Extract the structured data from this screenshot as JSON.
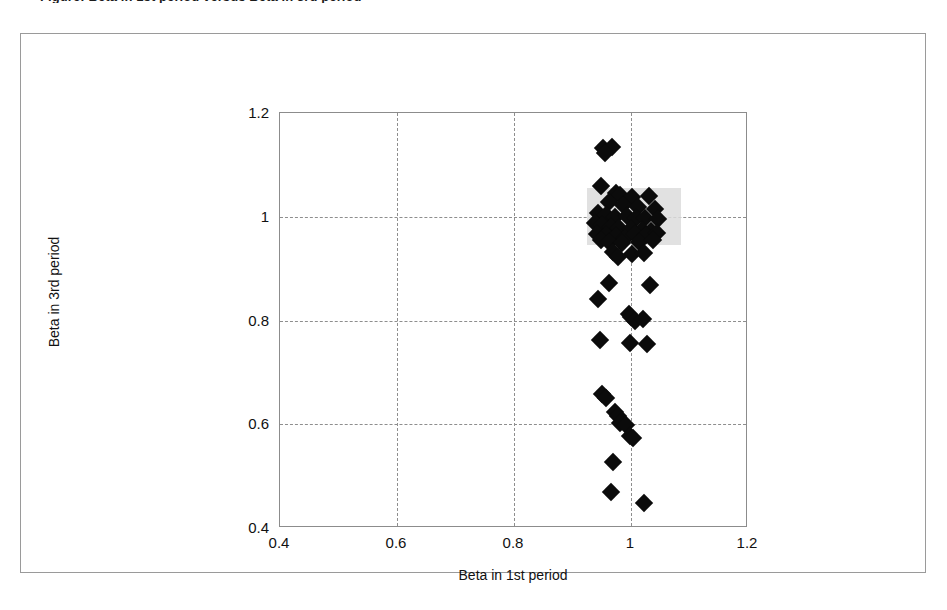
{
  "figure": {
    "caption": "Figure: Beta in 1st period versus Beta in 3rd period"
  },
  "chart_data": {
    "type": "scatter",
    "title": "",
    "xlabel": "Beta in 1st period",
    "ylabel": "Beta in 3rd period",
    "xlim": [
      0.4,
      1.2
    ],
    "ylim": [
      0.4,
      1.2
    ],
    "xticks": [
      "0.4",
      "0.6",
      "0.8",
      "1",
      "1.2"
    ],
    "yticks": [
      "0.4",
      "0.6",
      "0.8",
      "1",
      "1.2"
    ],
    "xtick_values": [
      0.4,
      0.6,
      0.8,
      1.0,
      1.2
    ],
    "ytick_values": [
      0.4,
      0.6,
      0.8,
      1.0,
      1.2
    ],
    "grid": true,
    "grid_style": "dashed",
    "legend": null,
    "marker": "diamond",
    "marker_color": "#0b0b0b",
    "highlight_region": {
      "label": "selection-highlight",
      "color": "#dcdcdc",
      "x_range": [
        0.925,
        1.085
      ],
      "y_range": [
        0.945,
        1.055
      ]
    },
    "points": [
      {
        "x": 0.952,
        "y": 1.133
      },
      {
        "x": 0.968,
        "y": 1.135
      },
      {
        "x": 0.955,
        "y": 1.122
      },
      {
        "x": 0.949,
        "y": 1.059
      },
      {
        "x": 0.975,
        "y": 1.046
      },
      {
        "x": 0.982,
        "y": 1.041
      },
      {
        "x": 1.002,
        "y": 1.038
      },
      {
        "x": 1.03,
        "y": 1.04
      },
      {
        "x": 0.962,
        "y": 1.028
      },
      {
        "x": 0.986,
        "y": 1.022
      },
      {
        "x": 1.012,
        "y": 1.018
      },
      {
        "x": 1.041,
        "y": 1.015
      },
      {
        "x": 0.944,
        "y": 1.008
      },
      {
        "x": 0.958,
        "y": 1.003
      },
      {
        "x": 0.972,
        "y": 1.0
      },
      {
        "x": 0.994,
        "y": 1.001
      },
      {
        "x": 1.008,
        "y": 0.998
      },
      {
        "x": 1.024,
        "y": 0.997
      },
      {
        "x": 1.046,
        "y": 0.995
      },
      {
        "x": 0.938,
        "y": 0.988
      },
      {
        "x": 0.951,
        "y": 0.984
      },
      {
        "x": 0.966,
        "y": 0.981
      },
      {
        "x": 0.98,
        "y": 0.978
      },
      {
        "x": 1.0,
        "y": 0.976
      },
      {
        "x": 1.018,
        "y": 0.974
      },
      {
        "x": 1.034,
        "y": 0.972
      },
      {
        "x": 0.942,
        "y": 0.967
      },
      {
        "x": 0.957,
        "y": 0.964
      },
      {
        "x": 0.974,
        "y": 0.962
      },
      {
        "x": 0.99,
        "y": 0.96
      },
      {
        "x": 1.006,
        "y": 0.967
      },
      {
        "x": 1.026,
        "y": 0.965
      },
      {
        "x": 1.044,
        "y": 0.968
      },
      {
        "x": 0.948,
        "y": 0.955
      },
      {
        "x": 0.963,
        "y": 0.952
      },
      {
        "x": 0.985,
        "y": 0.95
      },
      {
        "x": 1.014,
        "y": 0.952
      },
      {
        "x": 1.038,
        "y": 0.955
      },
      {
        "x": 0.97,
        "y": 0.932
      },
      {
        "x": 1.001,
        "y": 0.928
      },
      {
        "x": 1.022,
        "y": 0.93
      },
      {
        "x": 0.978,
        "y": 0.922
      },
      {
        "x": 0.962,
        "y": 0.872
      },
      {
        "x": 1.033,
        "y": 0.868
      },
      {
        "x": 0.944,
        "y": 0.841
      },
      {
        "x": 0.996,
        "y": 0.812
      },
      {
        "x": 1.0,
        "y": 0.806
      },
      {
        "x": 1.006,
        "y": 0.8
      },
      {
        "x": 1.02,
        "y": 0.802
      },
      {
        "x": 0.947,
        "y": 0.762
      },
      {
        "x": 0.998,
        "y": 0.756
      },
      {
        "x": 1.028,
        "y": 0.754
      },
      {
        "x": 0.951,
        "y": 0.658
      },
      {
        "x": 0.957,
        "y": 0.65
      },
      {
        "x": 0.972,
        "y": 0.624
      },
      {
        "x": 0.978,
        "y": 0.615
      },
      {
        "x": 0.981,
        "y": 0.602
      },
      {
        "x": 0.992,
        "y": 0.598
      },
      {
        "x": 0.999,
        "y": 0.578
      },
      {
        "x": 1.004,
        "y": 0.574
      },
      {
        "x": 0.97,
        "y": 0.527
      },
      {
        "x": 0.966,
        "y": 0.47
      },
      {
        "x": 1.022,
        "y": 0.448
      }
    ]
  }
}
